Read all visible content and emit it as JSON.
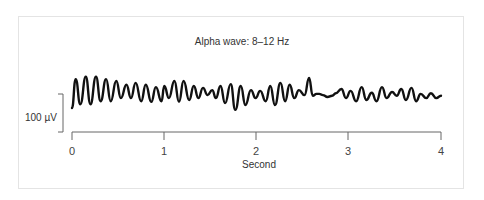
{
  "chart_data": {
    "type": "line",
    "title": "Alpha wave: 8–12 Hz",
    "xlabel": "Second",
    "ylabel": "",
    "xlim": [
      0,
      4
    ],
    "x_ticks": [
      "0",
      "1",
      "2",
      "3",
      "4"
    ],
    "scale_bar": {
      "label": "100 µV",
      "value_uV": 100
    },
    "grid": false,
    "legend": null,
    "series": [
      {
        "name": "EEG alpha wave",
        "description": "Oscillating EEG trace at ~10 cycles per second (8–12 Hz), amplitude roughly 50–100 µV peak-to-trough",
        "x": [
          0.0,
          0.04,
          0.09,
          0.15,
          0.2,
          0.26,
          0.31,
          0.37,
          0.42,
          0.48,
          0.53,
          0.59,
          0.64,
          0.69,
          0.75,
          0.8,
          0.86,
          0.91,
          0.97,
          1.0,
          1.05,
          1.11,
          1.16,
          1.21,
          1.27,
          1.32,
          1.37,
          1.42,
          1.47,
          1.52,
          1.56,
          1.61,
          1.66,
          1.72,
          1.77,
          1.83,
          1.88,
          1.94,
          1.99,
          2.04,
          2.1,
          2.15,
          2.2,
          2.26,
          2.31,
          2.36,
          2.41,
          2.46,
          2.52,
          2.57,
          2.61,
          2.65,
          2.68,
          2.72,
          2.77,
          2.82,
          2.86,
          2.92,
          2.97,
          3.02,
          3.08,
          3.14,
          3.19,
          3.25,
          3.3,
          3.36,
          3.41,
          3.47,
          3.52,
          3.57,
          3.62,
          3.68,
          3.73,
          3.78,
          3.84,
          3.89,
          3.95,
          4.0
        ],
        "y_uV": [
          0,
          76,
          10,
          82,
          10,
          82,
          18,
          76,
          18,
          71,
          26,
          61,
          26,
          66,
          18,
          61,
          16,
          55,
          18,
          58,
          26,
          71,
          16,
          71,
          21,
          58,
          26,
          53,
          34,
          47,
          26,
          58,
          13,
          63,
          -5,
          58,
          8,
          47,
          26,
          45,
          18,
          58,
          8,
          66,
          18,
          61,
          26,
          47,
          34,
          79,
          32,
          37,
          37,
          34,
          29,
          32,
          39,
          50,
          26,
          45,
          18,
          55,
          21,
          40,
          18,
          55,
          26,
          42,
          32,
          50,
          21,
          53,
          18,
          37,
          26,
          39,
          26,
          32
        ]
      }
    ]
  },
  "ui": {
    "title": "Alpha wave: 8–12 Hz",
    "scale_label": "100 µV",
    "xlabel": "Second",
    "ticks": [
      "0",
      "1",
      "2",
      "3",
      "4"
    ],
    "colors": {
      "trace": "#111111",
      "axis": "#666666",
      "frame": "#e4e4e4",
      "text": "#333333"
    }
  }
}
